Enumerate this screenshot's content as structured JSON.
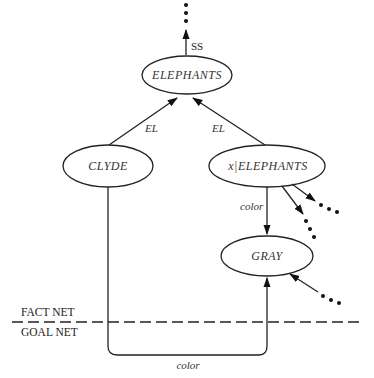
{
  "diagram": {
    "nodes": {
      "elephants": {
        "label": "ELEPHANTS"
      },
      "clyde": {
        "label": "CLYDE"
      },
      "x_elephants": {
        "label": "x|ELEPHANTS"
      },
      "gray": {
        "label": "GRAY"
      }
    },
    "edges": {
      "ss": {
        "label": "SS"
      },
      "clyde_el": {
        "label": "EL"
      },
      "x_el": {
        "label": "EL"
      },
      "x_color": {
        "label": "color"
      },
      "goal_color": {
        "label": "color"
      }
    },
    "partitions": {
      "fact_net": "FACT NET",
      "goal_net": "GOAL NET"
    },
    "colors": {
      "ink": "#222222",
      "background": "#ffffff"
    }
  }
}
